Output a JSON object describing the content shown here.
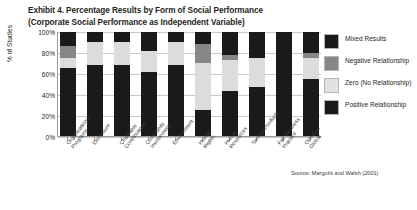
{
  "title": {
    "line1": "Exhibit 4. Percentage Results by Form of Social Performance",
    "line2": "(Corporate Social Performance as Independent Variable)"
  },
  "axes": {
    "ylabel": "% of Studies",
    "yticks": [
      "100%",
      "80%",
      "60%",
      "40%",
      "20%",
      "0%"
    ]
  },
  "legend": {
    "items": [
      {
        "label": "Mixed Results",
        "color": "#1a1a1a",
        "swatch": "sw-mixed"
      },
      {
        "label": "Negative Relationship",
        "color": "#878787",
        "swatch": "sw-negative"
      },
      {
        "label": "Zero (No Relationship)",
        "color": "#e2e2e2",
        "swatch": "sw-zero"
      },
      {
        "label": "Positive Relationship",
        "color": "#1a1a1a",
        "swatch": "sw-positive"
      }
    ]
  },
  "source": "Source: Margolis and Walsh (2001)",
  "chart_data": {
    "type": "bar",
    "subtype": "stacked-100-percent",
    "title": "Exhibit 4. Percentage Results by Form of Social Performance (Corporate Social Performance as Independent Variable)",
    "xlabel": "",
    "ylabel": "% of Studies",
    "ylim": [
      0,
      100
    ],
    "yticks": [
      0,
      20,
      40,
      60,
      80,
      100
    ],
    "grid": true,
    "legend_position": "right",
    "categories": [
      "Organizational Programs",
      "Disclosure",
      "Charitable Contributions",
      "Community Involvement",
      "Environment",
      "Human Rights",
      "Human Resources",
      "Service/Products",
      "Fair Business Practice",
      "Omnibus Global"
    ],
    "series": [
      {
        "name": "Positive Relationship",
        "color": "#1a1a1a",
        "values": [
          65,
          68,
          68,
          62,
          68,
          25,
          43,
          47,
          100,
          55
        ]
      },
      {
        "name": "Zero (No Relationship)",
        "color": "#e2e2e2",
        "values": [
          10,
          22,
          22,
          20,
          22,
          45,
          30,
          28,
          0,
          20
        ]
      },
      {
        "name": "Negative Relationship",
        "color": "#878787",
        "values": [
          12,
          0,
          0,
          0,
          0,
          18,
          5,
          0,
          0,
          5
        ]
      },
      {
        "name": "Mixed Results",
        "color": "#1a1a1a",
        "values": [
          13,
          10,
          10,
          18,
          10,
          12,
          22,
          25,
          0,
          20
        ]
      }
    ]
  }
}
